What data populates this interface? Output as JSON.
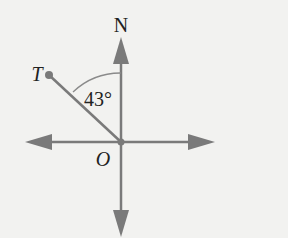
{
  "diagram": {
    "type": "compass-bearing",
    "labels": {
      "north": "N",
      "point": "T",
      "origin": "O",
      "angle": "43°"
    },
    "angle_degrees": 43,
    "colors": {
      "axis": "#7a7a7a",
      "arc": "#8a8a8a",
      "text": "#222222",
      "background": "#f2f2f0"
    }
  }
}
